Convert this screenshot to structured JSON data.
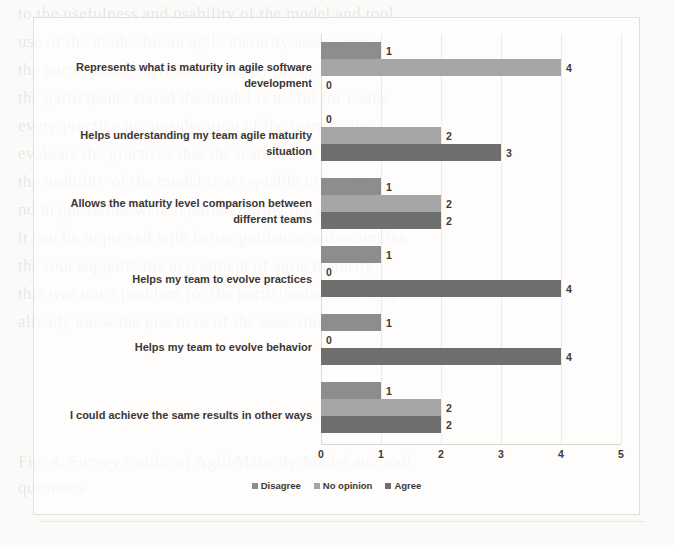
{
  "chart_data": {
    "type": "bar",
    "orientation": "horizontal",
    "title": "",
    "xlabel": "",
    "ylabel": "",
    "xlim": [
      0,
      5
    ],
    "xticks": [
      "0",
      "1",
      "2",
      "3",
      "4",
      "5"
    ],
    "grid": true,
    "legend_position": "bottom",
    "categories": [
      "Represents what is maturity in agile software development",
      "Helps understanding my team agile maturity situation",
      "Allows the maturity level comparison between different teams",
      "Helps my team to evolve practices",
      "Helps my team to evolve behavior",
      "I could achieve the same results in other ways"
    ],
    "series": [
      {
        "name": "Disagree",
        "color": "#8d8d8d",
        "values": [
          1,
          0,
          1,
          1,
          1,
          1
        ]
      },
      {
        "name": "No opinion",
        "color": "#a6a6a6",
        "values": [
          4,
          2,
          2,
          0,
          0,
          2
        ]
      },
      {
        "name": "Agree",
        "color": "#6f6f6f",
        "values": [
          0,
          3,
          2,
          4,
          4,
          2
        ]
      }
    ]
  },
  "ghost_text": [
    "to the usefulness and usability of the model and tool",
    "use of the model for an agile maturity assessment",
    "the participants expressed maturity is not well reflected",
    "the participants stated the model is useful for teams",
    "every practice in consideration of the team context",
    "evaluate the practices that the team wants to evolve",
    "the usability of the model is acceptable in practice",
    "no major issues were reported during the assessment",
    "it can be improved with better guidance and examples",
    "the tool supports the assessment of agile maturity",
    "this was not a problem for the participants since they",
    "already knew the practices of the assessment model",
    "",
    "",
    "",
    "Fig. 4. Survey results of AgileMaturity Model and tool",
    "questions"
  ]
}
